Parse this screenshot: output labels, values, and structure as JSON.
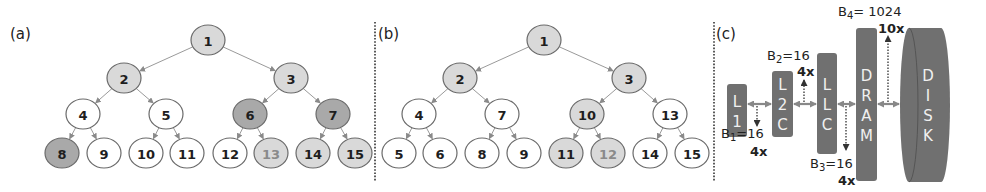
{
  "colors": {
    "white": "#ffffff",
    "light": "#d9d9d9",
    "dark": "#a9a9a9",
    "stroke": "#6a6a6a",
    "edge": "#9a9a9a",
    "text": "#1e1e1e",
    "faded_text": "#8a8a8a",
    "box": "#707070",
    "box_text": "#eeeeee",
    "divider": "#333333"
  },
  "panels": [
    {
      "label": "(a)",
      "label_pos": [
        10,
        39
      ],
      "nodes": [
        {
          "id": "1",
          "x": 208,
          "y": 40,
          "fill": "light",
          "text": "text"
        },
        {
          "id": "2",
          "x": 124,
          "y": 78,
          "fill": "light",
          "text": "text"
        },
        {
          "id": "3",
          "x": 291,
          "y": 78,
          "fill": "light",
          "text": "text"
        },
        {
          "id": "4",
          "x": 83,
          "y": 114,
          "fill": "white",
          "text": "text"
        },
        {
          "id": "5",
          "x": 166,
          "y": 114,
          "fill": "white",
          "text": "text"
        },
        {
          "id": "6",
          "x": 250,
          "y": 114,
          "fill": "dark",
          "text": "text"
        },
        {
          "id": "7",
          "x": 333,
          "y": 114,
          "fill": "dark",
          "text": "text"
        },
        {
          "id": "8",
          "x": 62,
          "y": 153,
          "fill": "dark",
          "text": "text"
        },
        {
          "id": "9",
          "x": 104,
          "y": 153,
          "fill": "white",
          "text": "text"
        },
        {
          "id": "10",
          "x": 146,
          "y": 153,
          "fill": "white",
          "text": "text"
        },
        {
          "id": "11",
          "x": 187,
          "y": 153,
          "fill": "white",
          "text": "text"
        },
        {
          "id": "12",
          "x": 230,
          "y": 153,
          "fill": "white",
          "text": "text"
        },
        {
          "id": "13",
          "x": 271,
          "y": 153,
          "fill": "light",
          "text": "faded_text"
        },
        {
          "id": "14",
          "x": 313,
          "y": 153,
          "fill": "light",
          "text": "text"
        },
        {
          "id": "15",
          "x": 355,
          "y": 153,
          "fill": "light",
          "text": "text"
        }
      ],
      "edges": [
        [
          "1",
          "2"
        ],
        [
          "1",
          "3"
        ],
        [
          "2",
          "4"
        ],
        [
          "2",
          "5"
        ],
        [
          "3",
          "6"
        ],
        [
          "3",
          "7"
        ],
        [
          "4",
          "8"
        ],
        [
          "4",
          "9"
        ],
        [
          "5",
          "10"
        ],
        [
          "5",
          "11"
        ],
        [
          "6",
          "12"
        ],
        [
          "6",
          "13"
        ],
        [
          "7",
          "14"
        ],
        [
          "7",
          "15"
        ]
      ]
    },
    {
      "label": "(b)",
      "label_pos": [
        378,
        39
      ],
      "nodes": [
        {
          "id": "1",
          "x": 544,
          "y": 40,
          "fill": "light",
          "text": "text"
        },
        {
          "id": "2",
          "x": 460,
          "y": 78,
          "fill": "light",
          "text": "text"
        },
        {
          "id": "3",
          "x": 629,
          "y": 78,
          "fill": "light",
          "text": "text"
        },
        {
          "id": "4",
          "x": 419,
          "y": 114,
          "fill": "white",
          "text": "text"
        },
        {
          "id": "7",
          "x": 502,
          "y": 114,
          "fill": "white",
          "text": "text"
        },
        {
          "id": "10",
          "x": 587,
          "y": 114,
          "fill": "light",
          "text": "text"
        },
        {
          "id": "13",
          "x": 670,
          "y": 114,
          "fill": "white",
          "text": "text"
        },
        {
          "id": "5",
          "x": 399,
          "y": 153,
          "fill": "white",
          "text": "text"
        },
        {
          "id": "6",
          "x": 440,
          "y": 153,
          "fill": "white",
          "text": "text"
        },
        {
          "id": "8",
          "x": 482,
          "y": 153,
          "fill": "white",
          "text": "text"
        },
        {
          "id": "9",
          "x": 524,
          "y": 153,
          "fill": "white",
          "text": "text"
        },
        {
          "id": "11",
          "x": 566,
          "y": 153,
          "fill": "light",
          "text": "text"
        },
        {
          "id": "12",
          "x": 608,
          "y": 153,
          "fill": "light",
          "text": "faded_text"
        },
        {
          "id": "14",
          "x": 650,
          "y": 153,
          "fill": "white",
          "text": "text"
        },
        {
          "id": "15",
          "x": 692,
          "y": 153,
          "fill": "white",
          "text": "text"
        }
      ],
      "edges": [
        [
          "1",
          "2"
        ],
        [
          "1",
          "3"
        ],
        [
          "2",
          "4"
        ],
        [
          "2",
          "7"
        ],
        [
          "3",
          "10"
        ],
        [
          "3",
          "13"
        ],
        [
          "4",
          "5"
        ],
        [
          "4",
          "6"
        ],
        [
          "7",
          "8"
        ],
        [
          "7",
          "9"
        ],
        [
          "10",
          "11"
        ],
        [
          "10",
          "12"
        ],
        [
          "13",
          "14"
        ],
        [
          "13",
          "15"
        ]
      ]
    }
  ],
  "dividers": [
    375,
    714
  ],
  "hierarchy": {
    "label": "(c)",
    "label_pos": [
      716,
      39
    ],
    "boxes": [
      {
        "name": "L1",
        "letters": [
          "L",
          "1"
        ],
        "x": 727,
        "y": 84,
        "w": 20,
        "h": 53
      },
      {
        "name": "L2C",
        "letters": [
          "L",
          "2",
          "C"
        ],
        "x": 772,
        "y": 71,
        "w": 21,
        "h": 66
      },
      {
        "name": "LLC",
        "letters": [
          "L",
          "L",
          "C"
        ],
        "x": 817,
        "y": 53,
        "w": 20,
        "h": 101
      },
      {
        "name": "DRAM",
        "letters": [
          "D",
          "R",
          "A",
          "M"
        ],
        "x": 856,
        "y": 28,
        "w": 21,
        "h": 153
      }
    ],
    "disk": {
      "name": "DISK",
      "letters": [
        "D",
        "I",
        "S",
        "K"
      ],
      "x": 900,
      "y": 28,
      "w": 50,
      "h": 154
    },
    "arrow_y": 104,
    "annotations": [
      {
        "id": "B1",
        "base": "B",
        "sub": "1",
        "value": "=16",
        "factor": "4x",
        "x": 721,
        "y": 138,
        "fx": 750,
        "fy": 156,
        "arrow": {
          "x": 757,
          "y1": 106,
          "y2": 126
        }
      },
      {
        "id": "B2",
        "base": "B",
        "sub": "2",
        "value": "=16",
        "factor": "4x",
        "x": 767,
        "y": 60,
        "fx": 797,
        "fy": 76,
        "arrow": {
          "x": 804,
          "y1": 102,
          "y2": 80
        }
      },
      {
        "id": "B3",
        "base": "B",
        "sub": "3",
        "value": "=16",
        "factor": "4x",
        "x": 810,
        "y": 168,
        "fx": 838,
        "fy": 185,
        "arrow": {
          "x": 846,
          "y1": 106,
          "y2": 150
        }
      },
      {
        "id": "B4",
        "base": "B",
        "sub": "4",
        "value": "= 1024",
        "factor": "10x",
        "x": 838,
        "y": 16,
        "fx": 878,
        "fy": 33,
        "arrow": {
          "x": 888,
          "y1": 102,
          "y2": 36
        }
      }
    ]
  }
}
